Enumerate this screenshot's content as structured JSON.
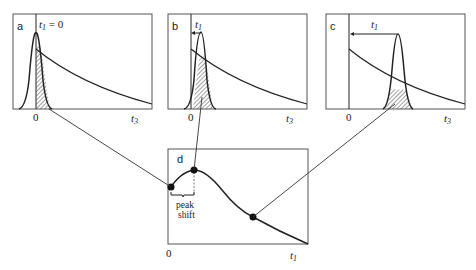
{
  "panels": {
    "a": {
      "label": "a",
      "annotation_var": "t",
      "annotation_sub": "1",
      "annotation_rest": " = 0",
      "x_origin": "0",
      "x_axis_var": "t",
      "x_axis_sub": "3"
    },
    "b": {
      "label": "b",
      "annotation_var": "t",
      "annotation_sub": "1",
      "x_origin": "0",
      "x_axis_var": "t",
      "x_axis_sub": "3"
    },
    "c": {
      "label": "c",
      "annotation_var": "t",
      "annotation_sub": "1",
      "x_origin": "0",
      "x_axis_var": "t",
      "x_axis_sub": "3"
    },
    "d": {
      "label": "d",
      "x_origin": "0",
      "x_axis_var": "t",
      "x_axis_sub": "1",
      "bracket_line1": "peak",
      "bracket_line2": "shift"
    }
  },
  "colors": {
    "line": "#222222",
    "frame": "#555555",
    "hatch": "#444444"
  }
}
